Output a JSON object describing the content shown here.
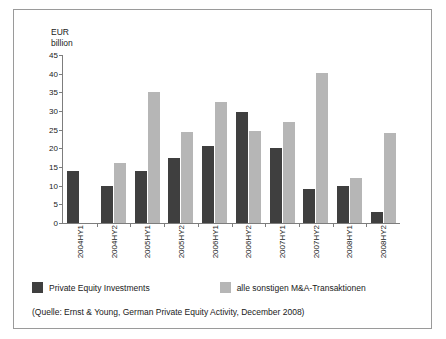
{
  "chart_data": {
    "type": "bar",
    "title": "",
    "xlabel": "",
    "ylabel": "EUR\nbillion",
    "ylim": [
      0,
      45
    ],
    "yticks": [
      45,
      40,
      35,
      30,
      25,
      20,
      15,
      10,
      5,
      0
    ],
    "grid": false,
    "legend_position": "bottom-left",
    "categories": [
      "2004HY1",
      "2004HY2",
      "2005HY1",
      "2005HY2",
      "2006HY1",
      "2006HY2",
      "2007HY1",
      "2007HY2",
      "2008HY1",
      "2008HY2"
    ],
    "series": [
      {
        "name": "Private Equity Investments",
        "color": "#3f3f3f",
        "values": [
          14,
          10,
          14,
          17.5,
          20.5,
          29.8,
          20.2,
          9,
          10,
          3
        ]
      },
      {
        "name": "alle sonstigen M&A-Transaktionen",
        "color": "#b6b6b6",
        "values": [
          null,
          16,
          35,
          24.5,
          32.5,
          24.7,
          27,
          40.3,
          12,
          24
        ]
      }
    ],
    "source_note": "(Quelle: Ernst & Young, German Private Equity Activity, December 2008)"
  },
  "axis": {
    "unit_label": "EUR\nbillion"
  },
  "colors": {
    "dark_series": "#3f3f3f",
    "light_series": "#b6b6b6",
    "axis": "#7d7d7d",
    "border": "#9a9a9a",
    "text": "#1a1a1a"
  }
}
